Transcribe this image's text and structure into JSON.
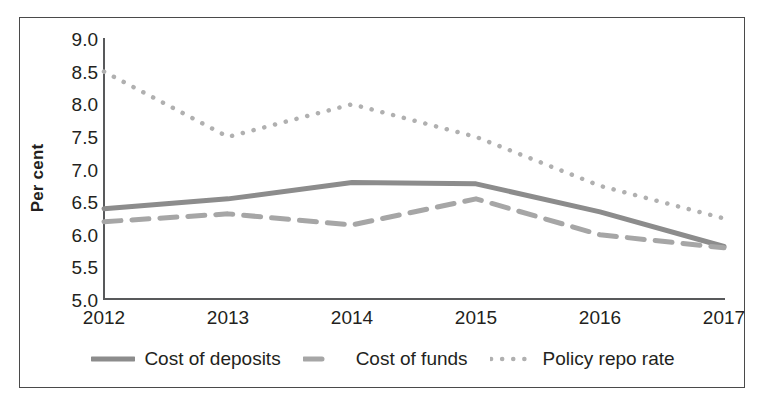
{
  "chart_data": {
    "type": "line",
    "title": "",
    "xlabel": "",
    "ylabel": "Per cent",
    "categories": [
      "2012",
      "2013",
      "2014",
      "2015",
      "2016",
      "2017"
    ],
    "x": [
      2012,
      2013,
      2014,
      2015,
      2016,
      2017
    ],
    "xlim": [
      2012,
      2017
    ],
    "ylim": [
      5.0,
      9.0
    ],
    "ytick_labels": [
      "9.0",
      "8.5",
      "8.0",
      "7.5",
      "7.0",
      "6.5",
      "6.0",
      "5.5",
      "5.0"
    ],
    "ytick_values": [
      9.0,
      8.5,
      8.0,
      7.5,
      7.0,
      6.5,
      6.0,
      5.5,
      5.0
    ],
    "grid": false,
    "legend_position": "bottom-center",
    "series": [
      {
        "name": "Cost of deposits",
        "style": "solid",
        "color": "#8c8c8c",
        "values": [
          6.4,
          6.55,
          6.8,
          6.78,
          6.35,
          5.82
        ]
      },
      {
        "name": "Cost of funds",
        "style": "dashed",
        "color": "#a6a6a6",
        "values": [
          6.2,
          6.32,
          6.15,
          6.55,
          6.0,
          5.8
        ]
      },
      {
        "name": "Policy repo rate",
        "style": "dotted",
        "color": "#b0b0b0",
        "values": [
          8.5,
          7.5,
          8.0,
          7.5,
          6.75,
          6.25
        ]
      }
    ]
  },
  "axis": {
    "y_title": "Per cent"
  },
  "legend": {
    "items": [
      {
        "label": "Cost of deposits",
        "swatch": "solid-line-swatch"
      },
      {
        "label": "Cost of funds",
        "swatch": "dashed-line-swatch"
      },
      {
        "label": "Policy repo rate",
        "swatch": "dotted-line-swatch"
      }
    ]
  },
  "colors": {
    "axis": "#58595b",
    "border": "#4a4a4a",
    "text": "#231f20",
    "series_solid": "#8c8c8c",
    "series_dashed": "#a6a6a6",
    "series_dotted": "#b0b0b0",
    "background": "#ffffff"
  }
}
